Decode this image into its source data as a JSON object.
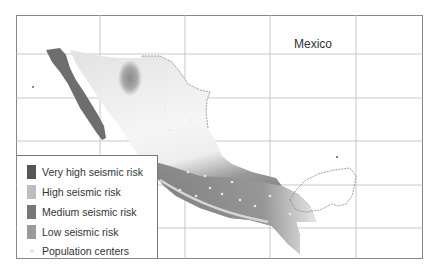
{
  "map": {
    "title": "Mexico",
    "grid": {
      "vertical_x": [
        100,
        185,
        270,
        356
      ],
      "horizontal_y": [
        54,
        98,
        141,
        185,
        228
      ]
    }
  },
  "legend": {
    "items": [
      {
        "label": "Very high seismic risk",
        "color": "#555555"
      },
      {
        "label": "High seismic risk",
        "color": "#bdbdbd"
      },
      {
        "label": "Medium seismic risk",
        "color": "#777777"
      },
      {
        "label": "Low seismic risk",
        "color": "#9a9a9a"
      },
      {
        "label": "Population centers",
        "color": "#e6e6e6",
        "marker": "dot"
      }
    ]
  }
}
